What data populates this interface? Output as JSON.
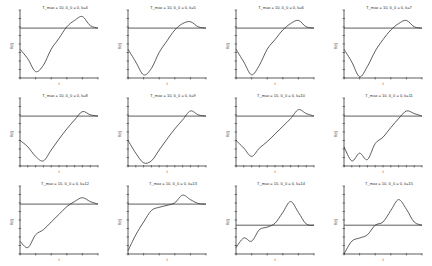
{
  "figure": {
    "rows": 3,
    "cols": 4,
    "line_color": "#333333",
    "background": "#ffffff"
  },
  "chart_data": [
    {
      "type": "line",
      "title": "T_max = 10, θ_0 = 0, k=4",
      "xlabel": "t",
      "ylabel": "θ(t)",
      "reference_level": 0.78,
      "x": [
        0,
        0.1,
        0.2,
        0.3,
        0.4,
        0.5,
        0.6,
        0.7,
        0.8,
        0.9,
        1.0
      ],
      "values": [
        0.45,
        0.3,
        0.1,
        0.2,
        0.45,
        0.62,
        0.8,
        0.9,
        0.96,
        0.82,
        0.78
      ]
    },
    {
      "type": "line",
      "title": "T_max = 10, θ_0 = 0, k=5",
      "xlabel": "t",
      "ylabel": "θ(t)",
      "reference_level": 0.78,
      "x": [
        0,
        0.1,
        0.2,
        0.3,
        0.4,
        0.5,
        0.6,
        0.7,
        0.8,
        0.9,
        1.0
      ],
      "values": [
        0.45,
        0.25,
        0.05,
        0.15,
        0.4,
        0.58,
        0.75,
        0.85,
        0.88,
        0.8,
        0.78
      ]
    },
    {
      "type": "line",
      "title": "T_max = 10, θ_0 = 0, k=6",
      "xlabel": "t",
      "ylabel": "θ(t)",
      "reference_level": 0.78,
      "x": [
        0,
        0.1,
        0.2,
        0.3,
        0.4,
        0.5,
        0.6,
        0.7,
        0.8,
        0.9,
        1.0
      ],
      "values": [
        0.45,
        0.25,
        0.05,
        0.2,
        0.45,
        0.6,
        0.75,
        0.85,
        0.9,
        0.8,
        0.78
      ]
    },
    {
      "type": "line",
      "title": "T_max = 10, θ_0 = 0, k=7",
      "xlabel": "t",
      "ylabel": "θ(t)",
      "reference_level": 0.78,
      "x": [
        0,
        0.1,
        0.2,
        0.3,
        0.4,
        0.5,
        0.6,
        0.7,
        0.8,
        0.9,
        1.0
      ],
      "values": [
        0.45,
        0.25,
        0.02,
        0.18,
        0.42,
        0.6,
        0.75,
        0.85,
        0.9,
        0.8,
        0.78
      ]
    },
    {
      "type": "line",
      "title": "T_max = 10, θ_0 = 0, k=8",
      "xlabel": "t",
      "ylabel": "θ(t)",
      "reference_level": 0.78,
      "x": [
        0,
        0.1,
        0.2,
        0.3,
        0.4,
        0.5,
        0.6,
        0.7,
        0.8,
        0.9,
        1.0
      ],
      "values": [
        0.4,
        0.3,
        0.15,
        0.08,
        0.25,
        0.42,
        0.58,
        0.72,
        0.85,
        0.8,
        0.78
      ]
    },
    {
      "type": "line",
      "title": "T_max = 10, θ_0 = 0, k=9",
      "xlabel": "t",
      "ylabel": "θ(t)",
      "reference_level": 0.78,
      "x": [
        0,
        0.1,
        0.2,
        0.3,
        0.4,
        0.5,
        0.6,
        0.7,
        0.8,
        0.9,
        1.0
      ],
      "values": [
        0.4,
        0.2,
        0.05,
        0.08,
        0.25,
        0.42,
        0.58,
        0.72,
        0.86,
        0.8,
        0.78
      ]
    },
    {
      "type": "line",
      "title": "T_max = 10, θ_0 = 0, k=10",
      "xlabel": "t",
      "ylabel": "θ(t)",
      "reference_level": 0.78,
      "x": [
        0,
        0.1,
        0.2,
        0.3,
        0.4,
        0.5,
        0.6,
        0.7,
        0.8,
        0.9,
        1.0
      ],
      "values": [
        0.4,
        0.28,
        0.15,
        0.28,
        0.38,
        0.5,
        0.62,
        0.74,
        0.88,
        0.82,
        0.78
      ]
    },
    {
      "type": "line",
      "title": "T_max = 10, θ_0 = 0, k=11",
      "xlabel": "t",
      "ylabel": "θ(t)",
      "reference_level": 0.78,
      "x": [
        0,
        0.1,
        0.2,
        0.3,
        0.4,
        0.5,
        0.6,
        0.7,
        0.8,
        0.9,
        1.0
      ],
      "values": [
        0.3,
        0.08,
        0.2,
        0.1,
        0.35,
        0.45,
        0.6,
        0.74,
        0.86,
        0.82,
        0.78
      ]
    },
    {
      "type": "line",
      "title": "T_max = 10, θ_0 = 0, k=12",
      "xlabel": "t",
      "ylabel": "θ(t)",
      "reference_level": 0.78,
      "x": [
        0,
        0.1,
        0.2,
        0.3,
        0.4,
        0.5,
        0.6,
        0.7,
        0.8,
        0.9,
        1.0
      ],
      "values": [
        0.2,
        0.1,
        0.3,
        0.38,
        0.5,
        0.62,
        0.74,
        0.82,
        0.88,
        0.82,
        0.78
      ]
    },
    {
      "type": "line",
      "title": "T_max = 10, θ_0 = 0, k=13",
      "xlabel": "t",
      "ylabel": "θ(t)",
      "reference_level": 0.78,
      "x": [
        0,
        0.1,
        0.2,
        0.3,
        0.4,
        0.5,
        0.6,
        0.7,
        0.8,
        0.9,
        1.0
      ],
      "values": [
        0.05,
        0.3,
        0.5,
        0.68,
        0.73,
        0.76,
        0.8,
        0.92,
        0.85,
        0.79,
        0.78
      ]
    },
    {
      "type": "line",
      "title": "T_max = 10, θ_0 = 0, k=14",
      "xlabel": "t",
      "ylabel": "θ(t)",
      "reference_level": 0.45,
      "x": [
        0,
        0.1,
        0.2,
        0.3,
        0.4,
        0.5,
        0.6,
        0.7,
        0.8,
        0.9,
        1.0
      ],
      "values": [
        0.1,
        0.25,
        0.2,
        0.38,
        0.42,
        0.48,
        0.65,
        0.82,
        0.65,
        0.47,
        0.45
      ]
    },
    {
      "type": "line",
      "title": "T_max = 10, θ_0 = 0, k=15",
      "xlabel": "t",
      "ylabel": "θ(t)",
      "reference_level": 0.45,
      "x": [
        0,
        0.1,
        0.2,
        0.3,
        0.4,
        0.5,
        0.6,
        0.7,
        0.8,
        0.9,
        1.0
      ],
      "values": [
        0.0,
        0.2,
        0.25,
        0.3,
        0.45,
        0.5,
        0.68,
        0.85,
        0.7,
        0.5,
        0.45
      ]
    }
  ]
}
